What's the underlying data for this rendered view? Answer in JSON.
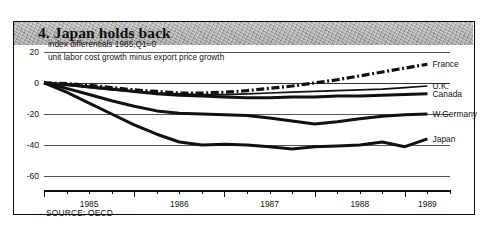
{
  "title": "4. Japan holds back",
  "subtitle_line1": "index differentials 1985,Q1=0",
  "subtitle_line2": "unit labor cost growth minus export price growth",
  "source": "SOURCE: OECD",
  "chart_data": {
    "type": "line",
    "title": "4. Japan holds back",
    "subtitle": "index differentials 1985,Q1=0 / unit labor cost growth minus export price growth",
    "xlabel": "",
    "ylabel": "",
    "ylim": [
      -65,
      25
    ],
    "xlim": [
      1985.0,
      1989.5
    ],
    "yticks": [
      20,
      0,
      -20,
      -40,
      -60
    ],
    "ytick_labels": [
      "20",
      "0",
      "-20",
      "-40",
      "-60"
    ],
    "xtick_labels": [
      "1985",
      "1986",
      "1987",
      "1988",
      "1989"
    ],
    "xtick_values": [
      1985.5,
      1986.5,
      1987.5,
      1988.5,
      1989.25
    ],
    "minor_tick_interval_quarters": 1,
    "grid": true,
    "legend_position": "right-inline",
    "source_note": "SOURCE: OECD",
    "x": [
      1985.0,
      1985.25,
      1985.5,
      1985.75,
      1986.0,
      1986.25,
      1986.5,
      1986.75,
      1987.0,
      1987.25,
      1987.5,
      1987.75,
      1988.0,
      1988.25,
      1988.5,
      1988.75,
      1989.0,
      1989.25
    ],
    "series": [
      {
        "name": "France",
        "style": "dash-dot",
        "color": "#111111",
        "values": [
          0,
          -0.5,
          -1.5,
          -3,
          -4.5,
          -5.5,
          -6.5,
          -6.5,
          -6,
          -5,
          -3.5,
          -2,
          0,
          2,
          4.5,
          7,
          9.5,
          12
        ]
      },
      {
        "name": "U.K.",
        "style": "solid",
        "color": "#111111",
        "values": [
          0,
          -1.5,
          -3,
          -4.5,
          -5.5,
          -6.5,
          -7,
          -7.5,
          -7.5,
          -7,
          -6.5,
          -6,
          -5.5,
          -5,
          -4.5,
          -4,
          -3,
          -2
        ]
      },
      {
        "name": "Canada",
        "style": "solid-thick",
        "color": "#111111",
        "values": [
          0,
          -1,
          -2.5,
          -4,
          -5.5,
          -7,
          -8,
          -8.5,
          -9,
          -9.5,
          -9.5,
          -9,
          -9,
          -8.5,
          -8.5,
          -8,
          -7.5,
          -7
        ]
      },
      {
        "name": "W.Germany",
        "style": "solid-thick",
        "color": "#111111",
        "values": [
          0,
          -3.5,
          -7.5,
          -11.5,
          -15,
          -18,
          -19.5,
          -20,
          -20.5,
          -21,
          -22.5,
          -24.5,
          -26.5,
          -25,
          -23,
          -21.5,
          -20.5,
          -20
        ]
      },
      {
        "name": "Japan",
        "style": "solid-thick",
        "color": "#111111",
        "values": [
          0,
          -6,
          -13,
          -20,
          -27,
          -33,
          -38,
          -40,
          -39.5,
          -40,
          -41,
          -42.5,
          -41,
          -40.5,
          -40,
          -38,
          -41,
          -36
        ]
      }
    ]
  },
  "series_labels": [
    {
      "name": "France",
      "text": "France"
    },
    {
      "name": "U.K.",
      "text": "U.K."
    },
    {
      "name": "Canada",
      "text": "Canada"
    },
    {
      "name": "W.Germany",
      "text": "W.Germany"
    },
    {
      "name": "Japan",
      "text": "Japan"
    }
  ]
}
